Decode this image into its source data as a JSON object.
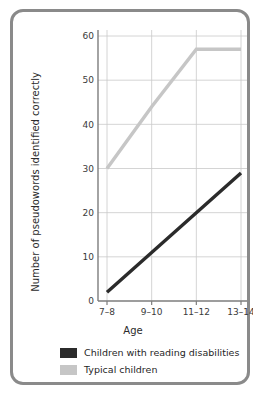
{
  "figure": {
    "frame_color": "#8a8a8a",
    "background": "#ffffff"
  },
  "chart_data": {
    "type": "line",
    "title": "",
    "xlabel": "Age",
    "ylabel": "Number of pseudowords identified correctly",
    "categories": [
      "7–8",
      "9–10",
      "11–12",
      "13–14"
    ],
    "xtick_labels": [
      "7–8",
      "9–10",
      "11–12",
      "13–14"
    ],
    "ytick_labels": [
      "0",
      "10",
      "20",
      "30",
      "40",
      "50",
      "60"
    ],
    "yticks": [
      0,
      10,
      20,
      30,
      40,
      50,
      60
    ],
    "ylim": [
      0,
      60
    ],
    "grid": true,
    "legend_position": "below-plot",
    "series": [
      {
        "name": "Children with reading disabilities",
        "color": "#2b2b2b",
        "values": [
          2,
          11,
          20,
          29
        ]
      },
      {
        "name": "Typical children",
        "color": "#c6c6c6",
        "values": [
          30,
          44,
          57,
          57
        ]
      }
    ]
  },
  "legend": {
    "items": [
      {
        "label": "Children with reading disabilities",
        "color": "#2b2b2b"
      },
      {
        "label": "Typical children",
        "color": "#c6c6c6"
      }
    ]
  }
}
